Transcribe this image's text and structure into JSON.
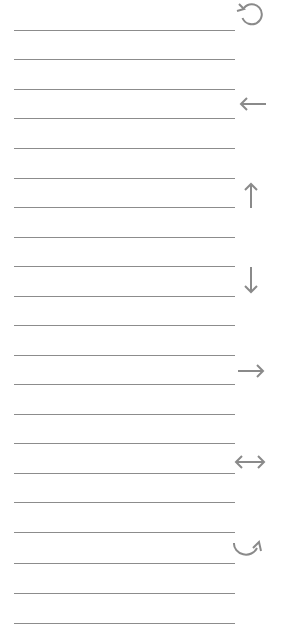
{
  "sheet": {
    "line_color": "#8c8c8c",
    "icon_color": "#8a8a8a",
    "lines_y": [
      30,
      59,
      89,
      118,
      148,
      178,
      207,
      237,
      266,
      296,
      325,
      355,
      384,
      414,
      443,
      473,
      502,
      532,
      563,
      593,
      623
    ]
  },
  "icons": [
    {
      "name": "rotate-counterclockwise-icon",
      "x": 235,
      "y": 1,
      "w": 30,
      "h": 26
    },
    {
      "name": "arrow-left-icon",
      "x": 238,
      "y": 96,
      "w": 30,
      "h": 16
    },
    {
      "name": "arrow-up-icon",
      "x": 243,
      "y": 181,
      "w": 16,
      "h": 28
    },
    {
      "name": "arrow-down-icon",
      "x": 243,
      "y": 266,
      "w": 16,
      "h": 29
    },
    {
      "name": "arrow-right-icon",
      "x": 237,
      "y": 363,
      "w": 30,
      "h": 16
    },
    {
      "name": "arrow-left-right-icon",
      "x": 233,
      "y": 454,
      "w": 34,
      "h": 16
    },
    {
      "name": "rotate-clockwise-icon",
      "x": 231,
      "y": 538,
      "w": 34,
      "h": 24
    }
  ]
}
